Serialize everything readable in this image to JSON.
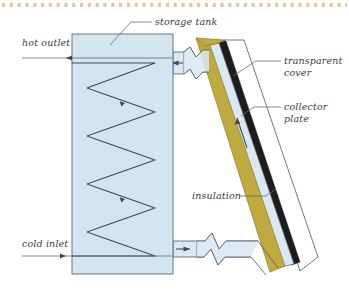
{
  "figure": {
    "type": "labelled-schematic-diagram"
  },
  "decor": {
    "top_dotted_rule": {
      "name": "dotted-rule",
      "color": "#e0c98a",
      "dash_count": 44
    }
  },
  "colors": {
    "tank_fill": "#d3e5f0",
    "pipe_fill": "#d9e8f2",
    "insulation_fill": "#bfaa3f",
    "cover_fill": "#ffffff",
    "plate_fill": "#1c1c1c",
    "outline": "#5a6a78",
    "coil_stroke": "#3c4a5a",
    "label_text": "#3a3a38",
    "leader_line": "#6b6b6b",
    "background": "#ffffff"
  },
  "labels": [
    {
      "id": "storage-tank",
      "text": "storage tank",
      "x": 155,
      "y": 26,
      "anchor": "start",
      "leader": [
        [
          152,
          22
        ],
        [
          130,
          22
        ],
        [
          110,
          45
        ]
      ]
    },
    {
      "id": "hot-outlet",
      "text": "hot outlet",
      "x": 22,
      "y": 46,
      "anchor": "start",
      "leader": [
        [
          22,
          58
        ],
        [
          72,
          58
        ]
      ]
    },
    {
      "id": "cold-inlet",
      "text": "cold inlet",
      "x": 22,
      "y": 248,
      "anchor": "start",
      "leader": [
        [
          22,
          256
        ],
        [
          72,
          256
        ]
      ]
    },
    {
      "id": "transparent-cover",
      "text": "transparent",
      "text2": "cover",
      "x": 283,
      "y": 64,
      "anchor": "start",
      "leader": [
        [
          281,
          61
        ],
        [
          258,
          61
        ],
        [
          240,
          76
        ]
      ]
    },
    {
      "id": "collector-plate",
      "text": "collector",
      "text2": "plate",
      "x": 283,
      "y": 110,
      "anchor": "start",
      "leader": [
        [
          281,
          107
        ],
        [
          252,
          107
        ],
        [
          240,
          116
        ]
      ]
    },
    {
      "id": "insulation",
      "text": "insulation",
      "x": 192,
      "y": 199,
      "anchor": "start",
      "leader": [
        [
          237,
          196
        ],
        [
          262,
          196
        ],
        [
          272,
          190
        ]
      ]
    }
  ],
  "components": {
    "storage_tank": {
      "name": "storage-tank",
      "x": 72,
      "y": 34,
      "width": 101,
      "height": 240,
      "fill": "#d3e5f0"
    },
    "heat_exchanger_coil": {
      "name": "heat-exchanger-coil",
      "zigzag_peaks": 6,
      "flow_arrows": 2
    },
    "top_pipe": {
      "name": "hot-outlet-pipe",
      "break_symbol": true,
      "flow_direction": "left"
    },
    "bottom_pipe": {
      "name": "cold-inlet-pipe",
      "break_symbol": true,
      "flow_direction": "right"
    },
    "collector_panel": {
      "name": "solar-collector-panel",
      "tilt_degrees": 52,
      "layers": [
        "transparent cover",
        "collector plate",
        "fluid channel",
        "insulation"
      ]
    }
  }
}
